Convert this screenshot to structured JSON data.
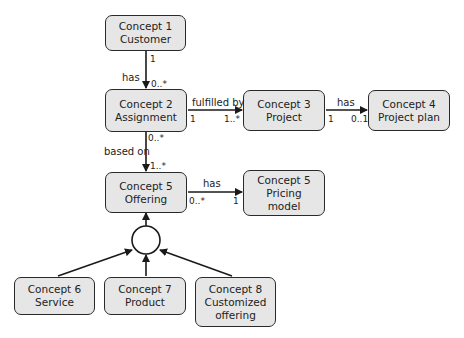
{
  "concepts": {
    "c1": {
      "line1": "Concept 1",
      "line2": "Customer",
      "line3": ""
    },
    "c2": {
      "line1": "Concept 2",
      "line2": "Assignment",
      "line3": ""
    },
    "c3": {
      "line1": "Concept 3",
      "line2": "Project",
      "line3": ""
    },
    "c4": {
      "line1": "Concept 4",
      "line2": "Project plan",
      "line3": ""
    },
    "c5": {
      "line1": "Concept 5",
      "line2": "Offering",
      "line3": ""
    },
    "c5p": {
      "line1": "Concept 5",
      "line2": "Pricing",
      "line3": "model"
    },
    "c6": {
      "line1": "Concept 6",
      "line2": "Service",
      "line3": ""
    },
    "c7": {
      "line1": "Concept 7",
      "line2": "Product",
      "line3": ""
    },
    "c8": {
      "line1": "Concept 8",
      "line2": "Customized",
      "line3": "offering"
    }
  },
  "relations": {
    "c1_c2": {
      "label": "has",
      "from_mult": "1",
      "to_mult": "0..*"
    },
    "c2_c3": {
      "label": "fulfilled by",
      "from_mult": "1",
      "to_mult": "1..*"
    },
    "c3_c4": {
      "label": "has",
      "from_mult": "1",
      "to_mult": "0..1"
    },
    "c2_c5": {
      "label": "based on",
      "from_mult": "0..*",
      "to_mult": "1..*"
    },
    "c5_c5p": {
      "label": "has",
      "from_mult": "0..*",
      "to_mult": "1"
    }
  },
  "colors": {
    "box_fill": "#e6e6e6",
    "stroke": "#2a2a2a"
  }
}
